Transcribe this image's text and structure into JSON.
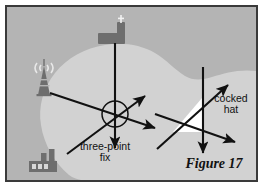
{
  "figure": {
    "caption": "Figure 17",
    "frame": {
      "border_color": "#3a3a3a",
      "page_background": "#ffffff"
    },
    "background": {
      "land_color": "#b4b4b4",
      "water_color": "#d2d2d2",
      "description": "coastline map with land and a bay of water"
    }
  },
  "labels": {
    "three_point_fix": "three-point\nfix",
    "cocked_hat": "cocked\nhat"
  },
  "landmarks": [
    {
      "name": "radio-tower",
      "icon": "radio-tower-icon",
      "color": "#6e6e6e",
      "x": 34,
      "y": 78
    },
    {
      "name": "church",
      "icon": "church-icon",
      "color": "#6e6e6e",
      "x": 104,
      "y": 27
    },
    {
      "name": "factory",
      "icon": "factory-icon",
      "color": "#6e6e6e",
      "x": 42,
      "y": 155
    }
  ],
  "diagrams": {
    "three_point_fix": {
      "description": "three position lines of bearing intersecting at a single point inside a small circle",
      "fix_circle": {
        "cx": 108,
        "cy": 107,
        "r": 13,
        "stroke": "#111111",
        "fill": "none"
      },
      "bearing_lines": [
        {
          "from": "church",
          "x1": 108,
          "y1": 36,
          "x2": 108,
          "y2": 141,
          "arrow": "end"
        },
        {
          "from": "radio-tower",
          "x1": 43,
          "y1": 86,
          "x2": 148,
          "y2": 121,
          "arrow": "end"
        },
        {
          "from": "factory",
          "x1": 60,
          "y1": 147,
          "x2": 138,
          "y2": 89,
          "arrow": "end"
        }
      ]
    },
    "cocked_hat": {
      "description": "three position lines that fail to meet at one point, forming a small white triangle",
      "triangle_fill": "#ffffff",
      "triangle_points": "195,91 195,125 166,125",
      "bearing_lines": [
        {
          "x1": 196,
          "y1": 60,
          "x2": 196,
          "y2": 146,
          "arrow": "end"
        },
        {
          "x1": 150,
          "y1": 142,
          "x2": 221,
          "y2": 78,
          "arrow": "end"
        },
        {
          "x1": 148,
          "y1": 107,
          "x2": 228,
          "y2": 135,
          "arrow": "end"
        }
      ]
    }
  },
  "colors": {
    "ink": "#111111",
    "land": "#b4b4b4",
    "water": "#d2d2d2",
    "icon": "#6e6e6e",
    "border": "#3a3a3a"
  }
}
